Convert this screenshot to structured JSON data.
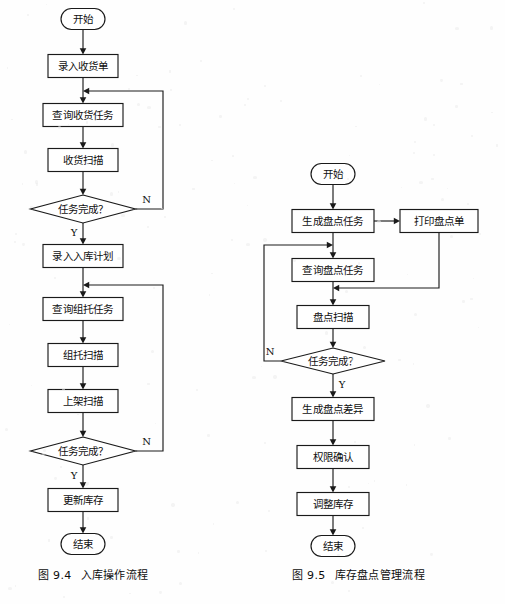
{
  "page": {
    "background_color": "#fefefe",
    "ink_color": "#1a1a1a",
    "width": 505,
    "height": 604
  },
  "figures": [
    {
      "id": "fig-9-4",
      "caption_number": "图 9.4",
      "caption_title": "入库操作流程",
      "caption_x": 38,
      "caption_y": 566,
      "nodes": [
        {
          "id": "l-start",
          "type": "terminator",
          "label": "开始",
          "cx": 83,
          "cy": 19,
          "w": 44,
          "h": 21
        },
        {
          "id": "l-p1",
          "type": "process",
          "label": "录入收货单",
          "cx": 83,
          "cy": 66,
          "w": 70,
          "h": 23
        },
        {
          "id": "l-p2",
          "type": "process",
          "label": "查询收货任务",
          "cx": 83,
          "cy": 115,
          "w": 80,
          "h": 23
        },
        {
          "id": "l-p3",
          "type": "process",
          "label": "收货扫描",
          "cx": 83,
          "cy": 160,
          "w": 70,
          "h": 23
        },
        {
          "id": "l-d1",
          "type": "decision",
          "label": "任务完成？",
          "cx": 83,
          "cy": 209,
          "w": 105,
          "h": 28
        },
        {
          "id": "l-p4",
          "type": "process",
          "label": "录入入库计划",
          "cx": 83,
          "cy": 256,
          "w": 80,
          "h": 23
        },
        {
          "id": "l-p5",
          "type": "process",
          "label": "查询组托任务",
          "cx": 83,
          "cy": 309,
          "w": 80,
          "h": 23
        },
        {
          "id": "l-p6",
          "type": "process",
          "label": "组托扫描",
          "cx": 83,
          "cy": 355,
          "w": 70,
          "h": 23
        },
        {
          "id": "l-p7",
          "type": "process",
          "label": "上架扫描",
          "cx": 83,
          "cy": 401,
          "w": 70,
          "h": 23
        },
        {
          "id": "l-d2",
          "type": "decision",
          "label": "任务完成？",
          "cx": 83,
          "cy": 451,
          "w": 105,
          "h": 28
        },
        {
          "id": "l-p8",
          "type": "process",
          "label": "更新库存",
          "cx": 83,
          "cy": 500,
          "w": 70,
          "h": 23
        },
        {
          "id": "l-end",
          "type": "terminator",
          "label": "结束",
          "cx": 83,
          "cy": 544,
          "w": 44,
          "h": 21
        }
      ],
      "edges": [
        {
          "id": "l-e1",
          "kind": "straight",
          "from": "l-start",
          "to": "l-p1"
        },
        {
          "id": "l-e2",
          "kind": "straight",
          "from": "l-p1",
          "to": "l-p2"
        },
        {
          "id": "l-e3",
          "kind": "straight",
          "from": "l-p2",
          "to": "l-p3"
        },
        {
          "id": "l-e4",
          "kind": "straight",
          "from": "l-p3",
          "to": "l-d1"
        },
        {
          "id": "l-e5",
          "kind": "straight",
          "from": "l-d1",
          "to": "l-p4",
          "label": "Y",
          "label_side": "left"
        },
        {
          "id": "l-e6",
          "kind": "straight",
          "from": "l-p4",
          "to": "l-p5"
        },
        {
          "id": "l-e7",
          "kind": "straight",
          "from": "l-p5",
          "to": "l-p6"
        },
        {
          "id": "l-e8",
          "kind": "straight",
          "from": "l-p6",
          "to": "l-p7"
        },
        {
          "id": "l-e9",
          "kind": "straight",
          "from": "l-p7",
          "to": "l-d2"
        },
        {
          "id": "l-e10",
          "kind": "straight",
          "from": "l-d2",
          "to": "l-p8",
          "label": "Y",
          "label_side": "left"
        },
        {
          "id": "l-e11",
          "kind": "straight",
          "from": "l-p8",
          "to": "l-end"
        },
        {
          "id": "l-fb1",
          "kind": "feedback",
          "from": "l-d1",
          "to": "l-p2",
          "label": "N",
          "rail_x": 163,
          "entry_y": 91,
          "exit_y": 209
        },
        {
          "id": "l-fb2",
          "kind": "feedback",
          "from": "l-d2",
          "to": "l-p5",
          "label": "N",
          "rail_x": 163,
          "entry_y": 285,
          "exit_y": 451
        }
      ]
    },
    {
      "id": "fig-9-5",
      "caption_number": "图 9.5",
      "caption_title": "库存盘点管理流程",
      "caption_x": 292,
      "caption_y": 566,
      "nodes": [
        {
          "id": "r-start",
          "type": "terminator",
          "label": "开始",
          "cx": 333,
          "cy": 174,
          "w": 44,
          "h": 21
        },
        {
          "id": "r-p1",
          "type": "process",
          "label": "生成盘点任务",
          "cx": 333,
          "cy": 221,
          "w": 82,
          "h": 23
        },
        {
          "id": "r-print",
          "type": "process",
          "label": "打印盘点单",
          "cx": 439,
          "cy": 221,
          "w": 78,
          "h": 23
        },
        {
          "id": "r-p2",
          "type": "process",
          "label": "查询盘点任务",
          "cx": 333,
          "cy": 270,
          "w": 82,
          "h": 23
        },
        {
          "id": "r-p3",
          "type": "process",
          "label": "盘点扫描",
          "cx": 333,
          "cy": 317,
          "w": 72,
          "h": 23
        },
        {
          "id": "r-d1",
          "type": "decision",
          "label": "任务完成？",
          "cx": 333,
          "cy": 361,
          "w": 104,
          "h": 26
        },
        {
          "id": "r-p4",
          "type": "process",
          "label": "生成盘点差异",
          "cx": 333,
          "cy": 409,
          "w": 82,
          "h": 23
        },
        {
          "id": "r-p5",
          "type": "process",
          "label": "权限确认",
          "cx": 333,
          "cy": 457,
          "w": 72,
          "h": 23
        },
        {
          "id": "r-p6",
          "type": "process",
          "label": "调整库存",
          "cx": 333,
          "cy": 504,
          "w": 72,
          "h": 23
        },
        {
          "id": "r-end",
          "type": "terminator",
          "label": "结束",
          "cx": 333,
          "cy": 546,
          "w": 44,
          "h": 21
        }
      ],
      "edges": [
        {
          "id": "r-e1",
          "kind": "straight",
          "from": "r-start",
          "to": "r-p1"
        },
        {
          "id": "r-e2",
          "kind": "straight",
          "from": "r-p1",
          "to": "r-p2"
        },
        {
          "id": "r-e3",
          "kind": "straight",
          "from": "r-p2",
          "to": "r-p3"
        },
        {
          "id": "r-e4",
          "kind": "straight",
          "from": "r-p3",
          "to": "r-d1"
        },
        {
          "id": "r-e5",
          "kind": "straight",
          "from": "r-d1",
          "to": "r-p4",
          "label": "Y",
          "label_side": "right"
        },
        {
          "id": "r-e6",
          "kind": "straight",
          "from": "r-p4",
          "to": "r-p5"
        },
        {
          "id": "r-e7",
          "kind": "straight",
          "from": "r-p5",
          "to": "r-p6"
        },
        {
          "id": "r-e8",
          "kind": "straight",
          "from": "r-p6",
          "to": "r-end"
        },
        {
          "id": "r-e9",
          "kind": "horizontal",
          "from": "r-p1",
          "to": "r-print"
        },
        {
          "id": "r-ret",
          "kind": "return-left",
          "from": "r-print",
          "to": "r-p2",
          "drop_y": 288,
          "target_x": 333
        },
        {
          "id": "r-fb1",
          "kind": "feedback-left",
          "from": "r-d1",
          "to": "r-p2",
          "label": "N",
          "rail_x": 264,
          "entry_y": 245,
          "exit_y": 361
        }
      ]
    }
  ]
}
